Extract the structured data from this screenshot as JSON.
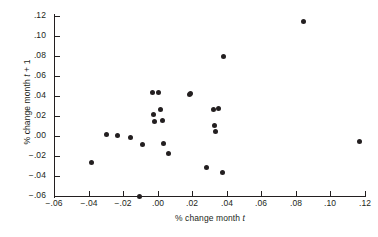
{
  "chart_data": {
    "type": "scatter",
    "title": "",
    "xlabel": "% change month t",
    "ylabel": "% change month t + 1",
    "xlabel_prefix": "% change month ",
    "xlabel_var": "t",
    "ylabel_prefix": "% change month ",
    "ylabel_var": "t",
    "ylabel_suffix": " + 1",
    "xlim": [
      -0.06,
      0.12
    ],
    "ylim": [
      -0.06,
      0.12
    ],
    "xticks": [
      -0.06,
      -0.04,
      -0.02,
      0.0,
      0.02,
      0.04,
      0.06,
      0.08,
      0.1,
      0.12
    ],
    "yticks": [
      -0.06,
      -0.04,
      -0.02,
      0.0,
      0.02,
      0.04,
      0.06,
      0.08,
      0.1,
      0.12
    ],
    "xticklabels": [
      "−.06",
      "−.04",
      "−.02",
      ".00",
      ".02",
      ".04",
      ".06",
      ".08",
      ".10",
      ".12"
    ],
    "yticklabels": [
      "−.06",
      "−.04",
      "−.02",
      ".00",
      ".02",
      ".04",
      ".06",
      ".08",
      ".10",
      ".12"
    ],
    "grid": false,
    "legend": null,
    "marker_color": "#231f20",
    "axis_color": "#231f20",
    "background": "#ffffff",
    "n_points": 23,
    "points": [
      {
        "x": -0.0385,
        "y": -0.0265
      },
      {
        "x": -0.0295,
        "y": 0.0012
      },
      {
        "x": -0.0235,
        "y": 0.0002
      },
      {
        "x": -0.0155,
        "y": -0.0018
      },
      {
        "x": -0.0105,
        "y": -0.06
      },
      {
        "x": -0.009,
        "y": -0.0085
      },
      {
        "x": -0.003,
        "y": 0.044
      },
      {
        "x": -0.0025,
        "y": 0.022
      },
      {
        "x": -0.002,
        "y": 0.015
      },
      {
        "x": 0.0005,
        "y": 0.0435
      },
      {
        "x": 0.0015,
        "y": 0.0265
      },
      {
        "x": 0.0025,
        "y": 0.016
      },
      {
        "x": 0.0035,
        "y": -0.007
      },
      {
        "x": 0.0065,
        "y": -0.0175
      },
      {
        "x": 0.0185,
        "y": 0.0415
      },
      {
        "x": 0.019,
        "y": 0.043
      },
      {
        "x": 0.028,
        "y": -0.031
      },
      {
        "x": 0.032,
        "y": 0.0265
      },
      {
        "x": 0.033,
        "y": 0.011
      },
      {
        "x": 0.0335,
        "y": 0.0045
      },
      {
        "x": 0.035,
        "y": 0.028
      },
      {
        "x": 0.0375,
        "y": -0.0365
      },
      {
        "x": 0.038,
        "y": 0.0795
      },
      {
        "x": 0.0845,
        "y": 0.1145
      },
      {
        "x": 0.117,
        "y": -0.0055
      }
    ]
  }
}
